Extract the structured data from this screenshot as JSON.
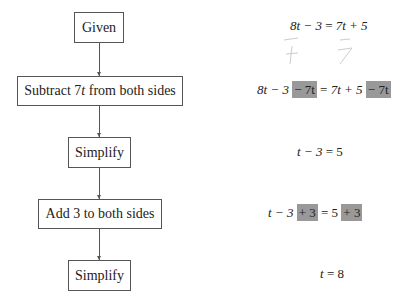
{
  "steps": [
    {
      "label": "Given",
      "equation": {
        "left": "8t − 3",
        "right": "7t + 5"
      }
    },
    {
      "label_pre": "Subtract 7",
      "label_var": "t",
      "label_post": " from both sides",
      "equation": {
        "left": "8t − 3",
        "left_hl": "− 7t",
        "right": "7t + 5",
        "right_hl": "− 7t"
      }
    },
    {
      "label": "Simplify",
      "equation": {
        "left": "t − 3",
        "right": "5"
      }
    },
    {
      "label": "Add 3 to both sides",
      "equation": {
        "left": "t − 3",
        "left_hl": "+ 3",
        "right": "5",
        "right_hl": "+ 3"
      }
    },
    {
      "label": "Simplify",
      "equation": {
        "left": "t",
        "right": "8"
      }
    }
  ],
  "equals": "=",
  "colors": {
    "highlight": "#999999",
    "border": "#555555"
  }
}
